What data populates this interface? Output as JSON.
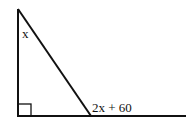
{
  "diagram": {
    "type": "geometry",
    "shape": "right triangle with extended base",
    "labels": {
      "top_angle": "x",
      "exterior_angle": "2x + 60"
    },
    "colors": {
      "stroke": "#111111",
      "background": "#ffffff"
    }
  }
}
